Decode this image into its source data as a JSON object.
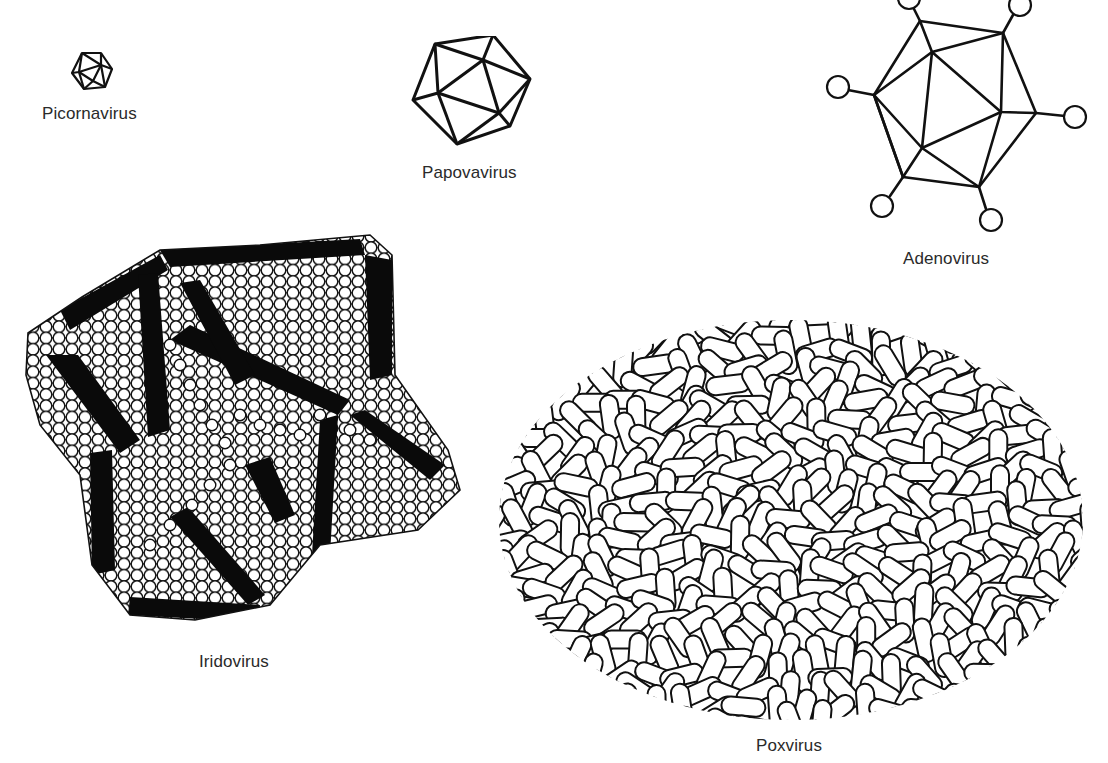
{
  "figure": {
    "top_caption_cropped": "",
    "stroke_color": "#111111",
    "background_color": "#ffffff",
    "viruses": [
      {
        "id": "picornavirus",
        "label": "Picornavirus",
        "shape": "small icosahedron"
      },
      {
        "id": "papovavirus",
        "label": "Papovavirus",
        "shape": "icosahedron"
      },
      {
        "id": "adenovirus",
        "label": "Adenovirus",
        "shape": "icosahedron with fibers and knobs"
      },
      {
        "id": "iridovirus",
        "label": "Iridovirus",
        "shape": "icosahedron of packed capsomeres"
      },
      {
        "id": "poxvirus",
        "label": "Poxvirus",
        "shape": "ovoid of tubular surface elements"
      }
    ]
  }
}
